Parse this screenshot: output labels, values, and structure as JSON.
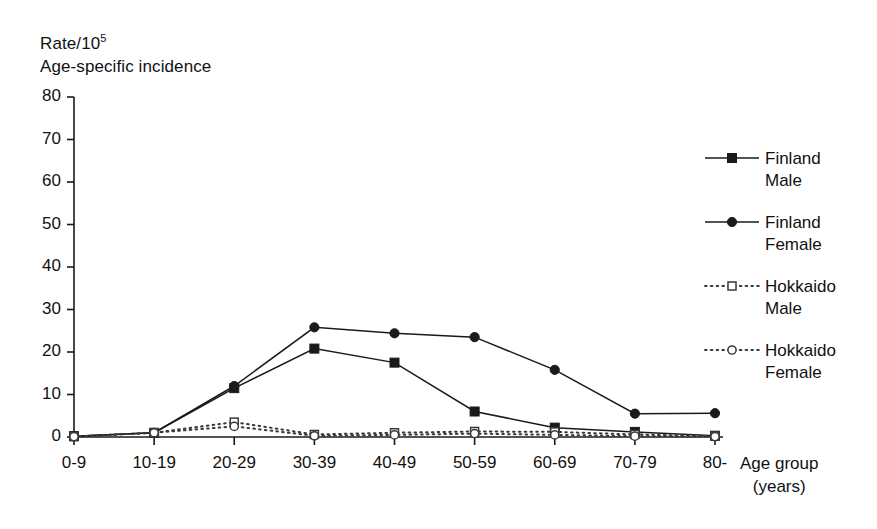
{
  "figure": {
    "ylabel_line1": "Rate/10",
    "ylabel_exponent": "5",
    "ylabel_line2": "Age-specific incidence",
    "xlabel_line1": "Age group",
    "xlabel_line2": "(years)"
  },
  "chart_data": {
    "type": "line",
    "title": "Age-specific incidence",
    "xlabel": "Age group (years)",
    "ylabel": "Rate/10^5",
    "categories": [
      "0-9",
      "10-19",
      "20-29",
      "30-39",
      "40-49",
      "50-59",
      "60-69",
      "70-79",
      "80-"
    ],
    "yticks": [
      0,
      10,
      20,
      30,
      40,
      50,
      60,
      70,
      80
    ],
    "ylim": [
      0,
      80
    ],
    "grid": false,
    "legend_position": "right",
    "series": [
      {
        "name": "Finland Male",
        "label_line1": "Finland",
        "label_line2": "Male",
        "marker": "filled-square",
        "linestyle": "solid",
        "color": "#1a1a1a",
        "values": [
          0.2,
          1.0,
          11.5,
          20.8,
          17.5,
          6.0,
          2.2,
          1.2,
          0.3
        ]
      },
      {
        "name": "Finland Female",
        "label_line1": "Finland",
        "label_line2": "Female",
        "marker": "filled-circle",
        "linestyle": "solid",
        "color": "#1a1a1a",
        "values": [
          0.2,
          1.0,
          12.0,
          25.8,
          24.4,
          23.5,
          15.8,
          5.5,
          5.6
        ]
      },
      {
        "name": "Hokkaido Male",
        "label_line1": "Hokkaido",
        "label_line2": "Male",
        "marker": "open-square",
        "linestyle": "dotted",
        "color": "#3a3a3a",
        "values": [
          0.1,
          1.0,
          3.5,
          0.6,
          1.0,
          1.3,
          1.2,
          0.6,
          0.2
        ]
      },
      {
        "name": "Hokkaido Female",
        "label_line1": "Hokkaido",
        "label_line2": "Female",
        "marker": "open-circle",
        "linestyle": "dotted",
        "color": "#3a3a3a",
        "values": [
          0.1,
          1.0,
          2.5,
          0.3,
          0.5,
          0.8,
          0.5,
          0.2,
          0.1
        ]
      }
    ]
  }
}
